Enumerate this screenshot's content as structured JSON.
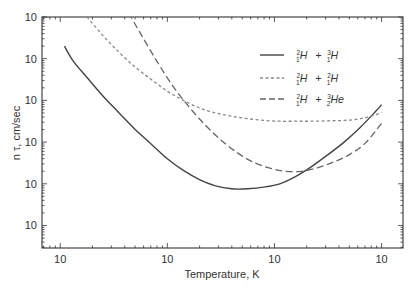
{
  "chart_data": {
    "type": "line",
    "title": "",
    "xlabel": "Temperature, K",
    "ylabel": "n τ, cm/sec",
    "x_scale": "log",
    "y_scale": "log",
    "x_tick_labels": [
      "10",
      "10",
      "10",
      "10"
    ],
    "y_tick_labels": [
      "10",
      "10",
      "10",
      "10",
      "10",
      "10"
    ],
    "x_decades": [
      0,
      1,
      2,
      3
    ],
    "y_decades": [
      1,
      2,
      3,
      4,
      5,
      6
    ],
    "xlim_decades": [
      -0.17,
      3.2
    ],
    "ylim_decades": [
      0.46,
      6.0
    ],
    "grid": false,
    "legend_position": "upper right",
    "series": [
      {
        "name": "D-T",
        "label_parts": [
          {
            "sup": "2",
            "sub": "1",
            "el": "H"
          },
          {
            "sup": "3",
            "sub": "1",
            "el": "H"
          }
        ],
        "style": "solid",
        "x_decade": [
          0.04,
          0.12,
          0.25,
          0.4,
          0.55,
          0.7,
          0.85,
          1.0,
          1.15,
          1.3,
          1.45,
          1.6,
          1.75,
          1.9,
          2.05,
          2.2,
          2.35,
          2.5,
          2.65,
          2.8,
          2.95,
          3.0
        ],
        "y_decade": [
          5.3,
          4.95,
          4.55,
          4.1,
          3.7,
          3.3,
          2.95,
          2.6,
          2.32,
          2.1,
          1.95,
          1.88,
          1.88,
          1.92,
          2.0,
          2.18,
          2.42,
          2.7,
          3.0,
          3.35,
          3.75,
          3.9
        ]
      },
      {
        "name": "D-D",
        "label_parts": [
          {
            "sup": "2",
            "sub": "1",
            "el": "H"
          },
          {
            "sup": "2",
            "sub": "1",
            "el": "H"
          }
        ],
        "style": "short-dash",
        "x_decade": [
          0.25,
          0.4,
          0.55,
          0.7,
          0.85,
          1.0,
          1.15,
          1.3,
          1.45,
          1.6,
          1.75,
          1.9,
          2.05,
          2.2,
          2.35,
          2.5,
          2.65,
          2.8,
          2.95,
          3.0
        ],
        "y_decade": [
          6.0,
          5.55,
          5.15,
          4.8,
          4.5,
          4.22,
          4.0,
          3.82,
          3.7,
          3.62,
          3.56,
          3.52,
          3.5,
          3.5,
          3.5,
          3.51,
          3.52,
          3.56,
          3.66,
          3.72
        ]
      },
      {
        "name": "D-He3",
        "label_parts": [
          {
            "sup": "2",
            "sub": "1",
            "el": "H"
          },
          {
            "sup": "3",
            "sub": "2",
            "el": "He"
          }
        ],
        "style": "long-dash",
        "x_decade": [
          0.64,
          0.75,
          0.9,
          1.05,
          1.2,
          1.35,
          1.5,
          1.65,
          1.8,
          1.95,
          2.1,
          2.25,
          2.4,
          2.55,
          2.7,
          2.85,
          3.0
        ],
        "y_decade": [
          6.1,
          5.6,
          4.95,
          4.35,
          3.85,
          3.42,
          3.05,
          2.75,
          2.52,
          2.38,
          2.3,
          2.3,
          2.38,
          2.52,
          2.7,
          2.98,
          3.45
        ]
      }
    ]
  },
  "legend": {
    "items": [
      {
        "a_sup": "2",
        "a_sub": "1",
        "a_el": "H",
        "plus": "+",
        "b_sup": "3",
        "b_sub": "1",
        "b_el": "H"
      },
      {
        "a_sup": "2",
        "a_sub": "1",
        "a_el": "H",
        "plus": "+",
        "b_sup": "2",
        "b_sub": "1",
        "b_el": "H"
      },
      {
        "a_sup": "2",
        "a_sub": "1",
        "a_el": "H",
        "plus": "+",
        "b_sup": "3",
        "b_sub": "2",
        "b_el": "He"
      }
    ]
  },
  "colors": {
    "axis": "#333333",
    "dt": "#444444",
    "dd": "#888888",
    "dhe3": "#666666"
  }
}
